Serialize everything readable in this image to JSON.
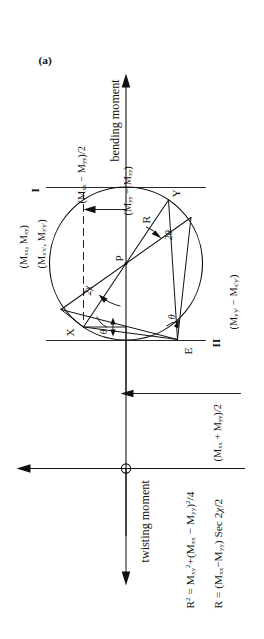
{
  "figure": {
    "caption": "(a)",
    "axes": {
      "vertical_axis_label": "bending moment",
      "horizontal_axis_label": "twisting moment",
      "axis_i_label": "I",
      "axis_ii_label": "II"
    },
    "points": {
      "x_point": "X",
      "y_point": "Y",
      "e_point": "E",
      "p_point": "P",
      "radius_label": "R"
    },
    "angles": {
      "theta_upper": "θ",
      "theta_lower": "θ",
      "two_chi": "2χ",
      "two_theta": "2θ"
    },
    "coordinate_labels": {
      "x_unprimed": "(M",
      "x_unprimed_sub1": "xx",
      "x_unprimed_mid": ", M",
      "x_unprimed_sub2": "xy",
      "x_unprimed_end": ")",
      "x_primed": "(M",
      "x_primed_sub1": "x′x′",
      "x_primed_mid": ", M",
      "x_primed_sub2": "x′y′",
      "x_primed_end": ")"
    },
    "dimension_labels": {
      "mean_moment": {
        "open": "(M",
        "sub1": "xx",
        "plus": " + M",
        "sub2": "yy",
        "close": ")/2"
      },
      "half_difference": {
        "open": "(M",
        "sub1": "xx",
        "minus": " − M",
        "sub2": "yy",
        "close": ")/2"
      },
      "y_coord": {
        "open": "(M",
        "sub1": "yy",
        "minus": " − M",
        "sub2": "xy",
        "close": ")"
      },
      "y_primed_coord": {
        "open": "(M",
        "sub1": "y′y′",
        "minus": " − M",
        "sub2": "x′y′",
        "close": ")"
      }
    },
    "equations": {
      "radius_squared": {
        "lhs": "R",
        "lhs_sup": "2",
        "eq": " = M",
        "sub1": "xy",
        "sup1": "2",
        "plus": "+(M",
        "sub2": "xx",
        "minus": " − M",
        "sub3": "yy",
        "close": ")",
        "sup2": "2",
        "tail": "/4"
      },
      "radius_secant": {
        "lhs": "R = (M",
        "sub1": "xx",
        "minus": "−M",
        "sub2": "yy",
        "close": ") Sec 2",
        "chi": "χ",
        "tail": "/2"
      }
    },
    "colors": {
      "ink": "#111111",
      "paper": "#ffffff"
    }
  }
}
